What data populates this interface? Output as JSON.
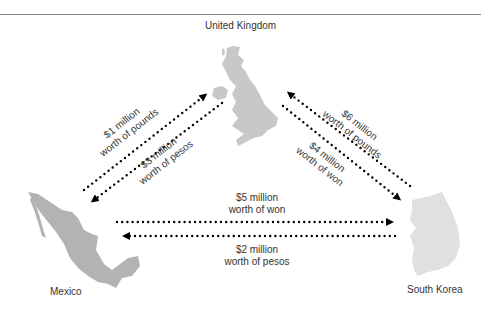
{
  "countries": {
    "uk": {
      "label": "United Kingdom",
      "color": "#c8c8c8"
    },
    "mexico": {
      "label": "Mexico",
      "color": "#b3b3b3"
    },
    "south_korea": {
      "label": "South Korea",
      "color": "#e0e0e0"
    }
  },
  "flows": [
    {
      "id": "mx-to-uk",
      "amount": "$1 million",
      "currency": "worth of pounds",
      "from": "Mexico",
      "to": "United Kingdom"
    },
    {
      "id": "uk-to-mx",
      "amount": "$3 million",
      "currency": "worth of pesos",
      "from": "United Kingdom",
      "to": "Mexico"
    },
    {
      "id": "sk-to-uk",
      "amount": "$6 million",
      "currency": "worth of pounds",
      "from": "South Korea",
      "to": "United Kingdom"
    },
    {
      "id": "uk-to-sk",
      "amount": "$4 million",
      "currency": "worth of won",
      "from": "United Kingdom",
      "to": "South Korea"
    },
    {
      "id": "mx-to-sk",
      "amount": "$5 million",
      "currency": "worth of won",
      "from": "Mexico",
      "to": "South Korea"
    },
    {
      "id": "sk-to-mx",
      "amount": "$2 million",
      "currency": "worth of pesos",
      "from": "South Korea",
      "to": "Mexico"
    }
  ],
  "style": {
    "arrow_color": "#000000",
    "rule_color": "#8a8a8a"
  }
}
